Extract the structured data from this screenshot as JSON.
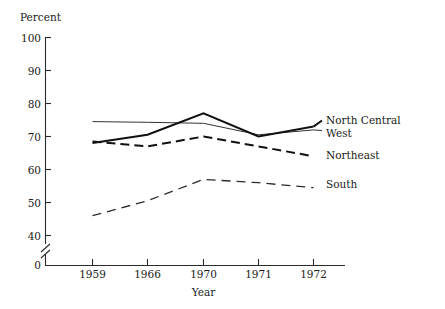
{
  "chart_data": {
    "type": "line",
    "title": "",
    "xlabel": "Year",
    "ylabel": "Percent",
    "x": [
      "1959",
      "1966",
      "1970",
      "1971",
      "1972"
    ],
    "categories": [
      "1959",
      "1966",
      "1970",
      "1971",
      "1972"
    ],
    "ylim": [
      40,
      100
    ],
    "y_axis_break": true,
    "y_axis_break_label": "0",
    "yticks": [
      "100",
      "90",
      "80",
      "70",
      "60",
      "50",
      "40"
    ],
    "ytick_values": [
      100,
      90,
      80,
      70,
      60,
      50,
      40
    ],
    "grid": false,
    "legend_position": "right-inline",
    "series": [
      {
        "name": "North Central",
        "style": "solid-thick",
        "values": [
          68,
          70.5,
          77,
          70,
          73
        ]
      },
      {
        "name": "West",
        "style": "solid-thin",
        "values": [
          74.5,
          74.3,
          74,
          70.5,
          72
        ]
      },
      {
        "name": "Northeast",
        "style": "dashed-thick",
        "values": [
          68.5,
          67,
          70,
          67,
          64
        ]
      },
      {
        "name": "South",
        "style": "dashed-thin",
        "values": [
          46,
          50.5,
          57,
          56,
          54.5
        ]
      }
    ]
  },
  "axis": {
    "y_label": "Percent",
    "x_label": "Year",
    "y_ticks": [
      "100",
      "90",
      "80",
      "70",
      "60",
      "50",
      "40"
    ],
    "zero_label": "0",
    "x_ticks": [
      "1959",
      "1966",
      "1970",
      "1971",
      "1972"
    ]
  },
  "legend": {
    "items": [
      {
        "label": "North Central"
      },
      {
        "label": "West"
      },
      {
        "label": "Northeast"
      },
      {
        "label": "South"
      }
    ]
  }
}
